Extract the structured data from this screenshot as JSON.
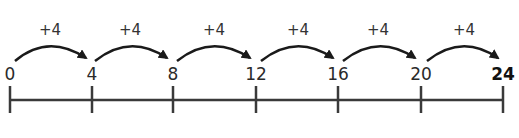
{
  "number_line": {
    "labels": [
      "0",
      "4",
      "8",
      "12",
      "16",
      "20",
      "24"
    ],
    "final_label": "24",
    "jumps": [
      "+4",
      "+4",
      "+4",
      "+4",
      "+4",
      "+4"
    ],
    "colors": {
      "line": "#3a3a3a",
      "arrow": "#1a1a1a",
      "text": "#2a2a2a"
    }
  }
}
